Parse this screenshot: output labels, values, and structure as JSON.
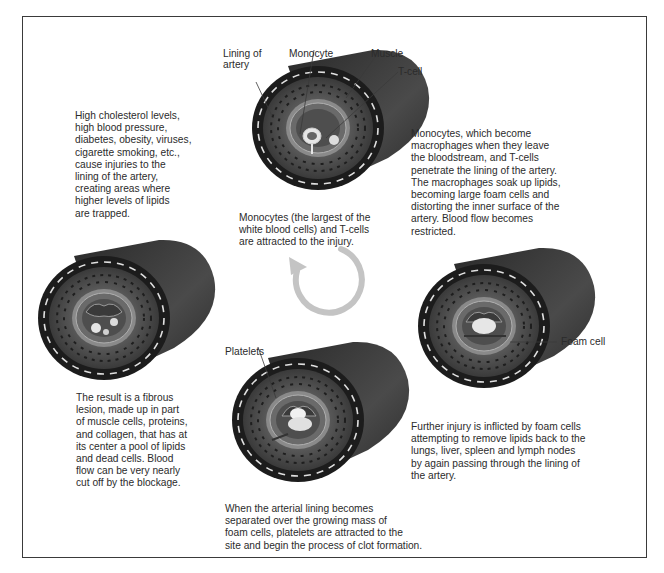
{
  "diagram": {
    "stages": [
      {
        "id": "stage-1",
        "description": "High cholesterol levels,\nhigh blood pressure,\ndiabetes, obesity, viruses,\ncigarette smoking, etc.,\ncause injuries to the\nlining of the artery,\ncreating areas where\nhigher levels of lipids\nare trapped."
      },
      {
        "id": "stage-2",
        "description": "Monocytes (the largest of the\nwhite blood cells) and T-cells\nare attracted to the injury.",
        "labels": {
          "lining": "Lining of\nartery",
          "monocyte": "Monocyte",
          "muscle": "Muscle",
          "tcell": "T-cell"
        }
      },
      {
        "id": "stage-3",
        "description": "Monocytes, which become\nmacrophages when they leave\nthe bloodstream, and T-cells\npenetrate the lining of the artery.\nThe macrophages soak up lipids,\nbecoming large foam cells and\ndistorting the inner surface of the\nartery. Blood flow becomes\nrestricted."
      },
      {
        "id": "stage-4",
        "description": "Further injury is inflicted by foam cells\nattempting to remove lipids back to the\nlungs, liver, spleen and lymph nodes\nby again passing through the lining of\nthe artery.",
        "labels": {
          "foam_cell": "Foam cell"
        }
      },
      {
        "id": "stage-5",
        "description": "When the arterial lining becomes\nseparated over the growing mass of\nfoam cells, platelets are attracted to the\nsite and begin the process of clot formation.",
        "labels": {
          "platelets": "Platelets"
        }
      },
      {
        "id": "stage-6",
        "description": "The result is a fibrous\nlesion, made up in part\nof muscle cells, proteins,\nand collagen, that has at\nits center a pool of lipids\nand dead cells. Blood\nflow can be very nearly\ncut off by the blockage."
      }
    ],
    "cycle_arrow": "counterclockwise-arrow",
    "colors": {
      "frame": "#3a3a3a",
      "vessel_dark": "#1e1e1e",
      "vessel_side": "#3c3c3c",
      "wall": "#4a4a4a",
      "lining": "#8a8a8a",
      "lumen": "#5a5a5a",
      "arrow": "#c4c4c4",
      "cell": "#e8e8e8"
    }
  }
}
